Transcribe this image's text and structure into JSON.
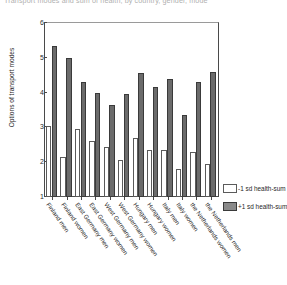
{
  "chart_data": {
    "type": "bar",
    "title": "Transport modes and sum of health, by country, gender, mode",
    "xlabel": "",
    "ylabel": "Options of transport modes",
    "ylim": [
      1,
      6
    ],
    "yticks": [
      1,
      2,
      3,
      4,
      5,
      6
    ],
    "grid": false,
    "legend_position": "right",
    "categories": [
      "Finland men",
      "Finland women",
      "East Germany men",
      "East Germany women",
      "West Germany men",
      "West Germany women",
      "Hungary men",
      "Hungary women",
      "Italy men",
      "Italy women",
      "the Netherlands women",
      "the Netherlands men"
    ],
    "series": [
      {
        "name": "-1 sd health-sum",
        "color": "#ffffff",
        "values": [
          3.05,
          2.15,
          2.95,
          2.6,
          2.45,
          2.05,
          2.7,
          2.35,
          2.35,
          1.8,
          2.3,
          1.95
        ]
      },
      {
        "name": "+1 sd health-sum",
        "color": "#6b6b6b",
        "values": [
          5.35,
          5.0,
          4.3,
          4.0,
          3.65,
          3.95,
          4.55,
          4.15,
          4.4,
          3.35,
          4.3,
          4.6
        ]
      }
    ]
  },
  "legend": {
    "items": [
      {
        "label": "-1 sd health-sum",
        "swatch": "low"
      },
      {
        "label": "+1 sd health-sum",
        "swatch": "high"
      }
    ]
  }
}
